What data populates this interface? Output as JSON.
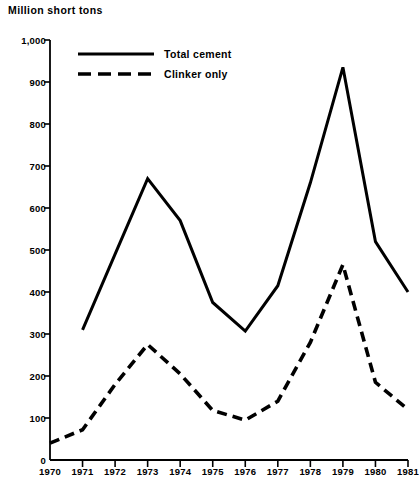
{
  "chart_data": {
    "type": "line",
    "title": "Million short tons",
    "xlabel": "",
    "ylabel": "Million short tons",
    "x": [
      1970,
      1971,
      1972,
      1973,
      1974,
      1975,
      1976,
      1977,
      1978,
      1979,
      1980,
      1981
    ],
    "categories": [
      "1970",
      "1971",
      "1972",
      "1973",
      "1974",
      "1975",
      "1976",
      "1977",
      "1978",
      "1979",
      "1980",
      "1981"
    ],
    "xlim": [
      1970,
      1981
    ],
    "ylim": [
      0,
      1000
    ],
    "yticks": [
      0,
      100,
      200,
      300,
      400,
      500,
      600,
      700,
      800,
      900,
      1000
    ],
    "ytick_labels": [
      "0",
      "100",
      "200",
      "300",
      "400",
      "500",
      "600",
      "700",
      "800",
      "900",
      "1,000"
    ],
    "grid": false,
    "legend_position": "top-left-inside",
    "series": [
      {
        "name": "Total cement",
        "style": "solid",
        "color": "#000000",
        "x": [
          1971,
          1972,
          1973,
          1974,
          1975,
          1976,
          1977,
          1978,
          1979,
          1980,
          1981
        ],
        "values": [
          310,
          490,
          670,
          570,
          375,
          307,
          415,
          660,
          935,
          520,
          400
        ]
      },
      {
        "name": "Clinker only",
        "style": "dashed",
        "color": "#000000",
        "x": [
          1970,
          1971,
          1972,
          1973,
          1974,
          1975,
          1976,
          1977,
          1978,
          1979,
          1980,
          1981
        ],
        "values": [
          40,
          72,
          180,
          275,
          205,
          118,
          95,
          140,
          280,
          465,
          185,
          120
        ]
      }
    ]
  },
  "legend": {
    "items": [
      {
        "label": "Total cement",
        "style": "solid"
      },
      {
        "label": "Clinker only",
        "style": "dashed"
      }
    ]
  }
}
